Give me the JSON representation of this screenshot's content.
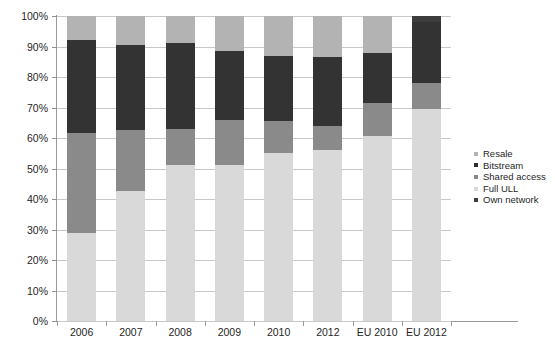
{
  "chart_data": {
    "type": "bar",
    "stacked": true,
    "percent": true,
    "title": "",
    "xlabel": "",
    "ylabel": "",
    "ylim": [
      0,
      100
    ],
    "yticks": [
      "0%",
      "10%",
      "20%",
      "30%",
      "40%",
      "50%",
      "60%",
      "70%",
      "80%",
      "90%",
      "100%"
    ],
    "ytick_values": [
      0,
      10,
      20,
      30,
      40,
      50,
      60,
      70,
      80,
      90,
      100
    ],
    "grid": true,
    "legend_position": "right",
    "categories": [
      "2006",
      "2007",
      "2008",
      "2009",
      "2010",
      "2012",
      "EU 2010",
      "EU 2012"
    ],
    "series": [
      {
        "name": "Own network",
        "color": "#d9d9d9",
        "values": [
          29.0,
          42.5,
          51.0,
          51.0,
          55.0,
          56.0,
          60.5,
          69.5
        ]
      },
      {
        "name": "Full ULL",
        "color": "#8a8a8a",
        "values": [
          32.5,
          20.0,
          12.0,
          15.0,
          10.5,
          8.0,
          11.0,
          8.5
        ]
      },
      {
        "name": "Shared access",
        "color": "#333333",
        "values": [
          30.5,
          28.0,
          28.0,
          22.5,
          21.5,
          22.5,
          16.5,
          20.0
        ]
      },
      {
        "name": "Bitstream",
        "color": "#b3b3b3",
        "values": [
          8.0,
          9.5,
          9.0,
          11.5,
          13.0,
          13.5,
          12.0,
          0.0
        ]
      },
      {
        "name": "Resale",
        "color": "#3d3d3d",
        "values": [
          0.0,
          0.0,
          0.0,
          0.0,
          0.0,
          0.0,
          0.0,
          2.0
        ]
      }
    ]
  },
  "legend": {
    "items": [
      {
        "label": "Resale",
        "color": "#b3b3b3"
      },
      {
        "label": "Bitstream",
        "color": "#2f2f2f"
      },
      {
        "label": "Shared access",
        "color": "#8a8a8a"
      },
      {
        "label": "Full ULL",
        "color": "#d9d9d9"
      },
      {
        "label": "Own network",
        "color": "#3d3d3d"
      }
    ]
  }
}
